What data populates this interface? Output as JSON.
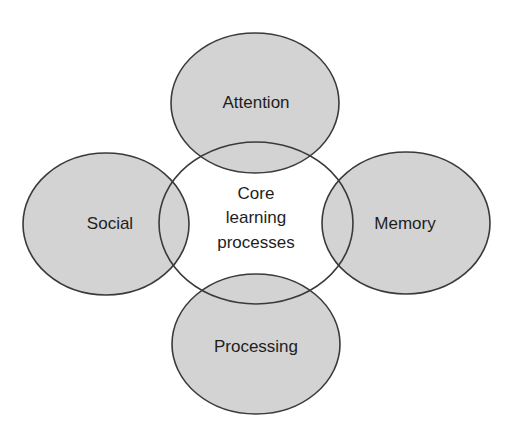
{
  "diagram": {
    "type": "venn-style concept diagram",
    "colors": {
      "outer_fill": "#d3d3d3",
      "center_fill": "#ffffff",
      "outline": "#3a3a3a",
      "text": "#1e1e1e"
    },
    "center": {
      "label_lines": [
        "Core",
        "learning",
        "processes"
      ]
    },
    "outer": [
      {
        "id": "attention",
        "label": "Attention",
        "position": "top"
      },
      {
        "id": "social",
        "label": "Social",
        "position": "left"
      },
      {
        "id": "memory",
        "label": "Memory",
        "position": "right"
      },
      {
        "id": "processing",
        "label": "Processing",
        "position": "bottom"
      }
    ]
  }
}
